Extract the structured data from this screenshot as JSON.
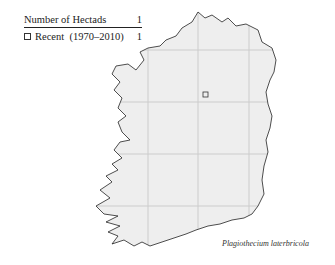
{
  "legend": {
    "header_label": "Number of Hectads",
    "header_value": "1",
    "rows": [
      {
        "label": "Recent  (1970–2010)",
        "value": "1",
        "symbol": "open-square"
      }
    ]
  },
  "map": {
    "region": "Ireland",
    "fill_color": "#eeeeee",
    "outline_color": "#222222",
    "grid_color": "#cccccc",
    "records": [
      {
        "period": "Recent (1970–2010)",
        "symbol": "open-square",
        "x": 205,
        "y": 94
      }
    ]
  },
  "species_name": "Plagiothecium laterbricola"
}
